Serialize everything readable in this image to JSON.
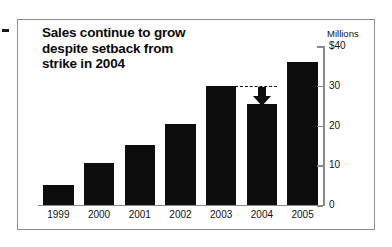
{
  "figure": {
    "title": "Sales continue to grow\ndespite setback from\nstrike in 2004",
    "y_axis_title": "Millions",
    "frame_color": "#8c8c8c",
    "bar_color": "#0d0d0d",
    "axis_color": "#8a8a8a"
  },
  "annotation": {
    "name": "setback-arrow",
    "reference_value": 30,
    "target_year": "2004"
  },
  "chart_data": {
    "type": "bar",
    "title": "Sales continue to grow despite setback from strike in 2004",
    "xlabel": "",
    "ylabel": "Millions",
    "ylim": [
      0,
      40
    ],
    "yticks": [
      0,
      10,
      20,
      30,
      40
    ],
    "ytick_labels": [
      "0",
      "10",
      "20",
      "30",
      "$40"
    ],
    "grid": false,
    "legend": null,
    "categories": [
      "1999",
      "2000",
      "2001",
      "2002",
      "2003",
      "2004",
      "2005"
    ],
    "values": [
      5,
      10.5,
      15,
      20.5,
      30,
      25.5,
      36
    ],
    "annotations": [
      {
        "type": "dashed-reference-line",
        "value": 30,
        "from_category": "2003",
        "to_category": "2004"
      },
      {
        "type": "down-arrow",
        "at_category": "2004",
        "from_value": 30,
        "to_value": 25.5
      }
    ]
  }
}
